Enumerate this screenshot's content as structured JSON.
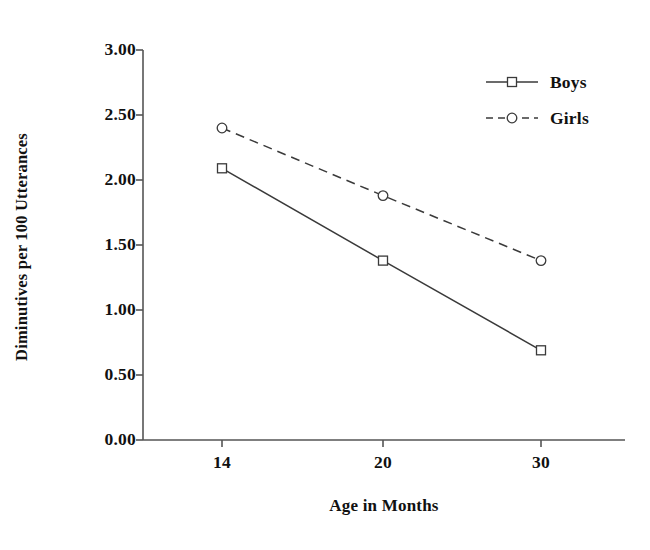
{
  "chart_data": {
    "type": "line",
    "title": "",
    "xlabel": "Age in Months",
    "ylabel": "Diminutives per 100 Utterances",
    "categories": [
      "14",
      "20",
      "30"
    ],
    "series": [
      {
        "name": "Boys",
        "values": [
          2.09,
          1.38,
          0.69
        ],
        "marker": "open-square",
        "linestyle": "solid",
        "color": "#3a3a3a"
      },
      {
        "name": "Girls",
        "values": [
          2.4,
          1.88,
          1.38
        ],
        "marker": "open-circle",
        "linestyle": "dashed",
        "color": "#3a3a3a"
      }
    ],
    "ylim": [
      0.0,
      3.0
    ],
    "ytick_labels": [
      "0.00",
      "0.50",
      "1.00",
      "1.50",
      "2.00",
      "2.50",
      "3.00"
    ],
    "ytick_values": [
      0.0,
      0.5,
      1.0,
      1.5,
      2.0,
      2.5,
      3.0
    ],
    "xtick_labels": [
      "14",
      "20",
      "30"
    ],
    "grid": false,
    "legend_position": "top-right",
    "background_color": "#ffffff",
    "axis_color": "#555555"
  },
  "legend": {
    "items": [
      {
        "label": "Boys"
      },
      {
        "label": "Girls"
      }
    ]
  },
  "axes": {
    "y_title": "Diminutives per 100 Utterances",
    "x_title": "Age in Months"
  }
}
